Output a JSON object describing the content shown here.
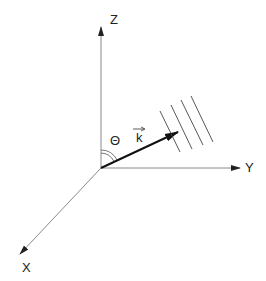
{
  "diagram": {
    "axes": {
      "z_label": "Z",
      "y_label": "Y",
      "x_label": "X"
    },
    "vector_label": "k",
    "angle_label": "Θ",
    "wavefront_count": 4,
    "colors": {
      "axis": "#8a8a8a",
      "vector": "#111111",
      "text": "#222222"
    }
  }
}
